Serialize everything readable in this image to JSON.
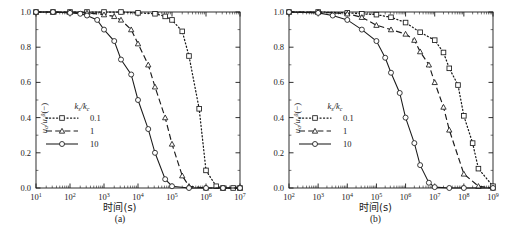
{
  "figure": {
    "panels": [
      {
        "id": "a",
        "caption": "(a)",
        "xlabel": "时间(s)",
        "ylabel_num": "u",
        "ylabel_sub": "a",
        "ylabel_den": "u",
        "ylabel_den_sub": "a",
        "ylabel_den_sup": "0",
        "ylabel_unit": "(−)",
        "legend_title_a": "k",
        "legend_title_a_sub": "s",
        "legend_title_b": "k",
        "legend_title_b_sub": "c",
        "legend_title": "k s / k c",
        "legend": [
          {
            "label": "0.1",
            "style": "dotted",
            "marker": "square"
          },
          {
            "label": "1",
            "style": "dashed",
            "marker": "triangle"
          },
          {
            "label": "10",
            "style": "solid",
            "marker": "circle"
          }
        ],
        "xticks": [
          "10¹",
          "10²",
          "10³",
          "10⁴",
          "10⁵",
          "10⁶",
          "10⁷"
        ],
        "xtick_exponents": [
          "1",
          "2",
          "3",
          "4",
          "5",
          "6",
          "7"
        ],
        "yticks": [
          "0.0",
          "0.2",
          "0.4",
          "0.6",
          "0.8",
          "1.0"
        ]
      },
      {
        "id": "b",
        "caption": "(b)",
        "xlabel": "时间(s)",
        "ylabel_num": "u",
        "ylabel_sub": "a",
        "ylabel_den": "u",
        "ylabel_den_sub": "a",
        "ylabel_den_sup": "0",
        "ylabel_unit": "(−)",
        "legend_title_a": "k",
        "legend_title_a_sub": "s",
        "legend_title_b": "k",
        "legend_title_b_sub": "c",
        "legend_title": "k s / k c",
        "legend": [
          {
            "label": "0.1",
            "style": "dotted",
            "marker": "square"
          },
          {
            "label": "1",
            "style": "dashed",
            "marker": "triangle"
          },
          {
            "label": "10",
            "style": "solid",
            "marker": "circle"
          }
        ],
        "xticks": [
          "10²",
          "10³",
          "10⁴",
          "10⁵",
          "10⁶",
          "10⁷",
          "10⁸",
          "10⁹"
        ],
        "xtick_exponents": [
          "2",
          "3",
          "4",
          "5",
          "6",
          "7",
          "8",
          "9"
        ],
        "yticks": [
          "0.0",
          "0.2",
          "0.4",
          "0.6",
          "0.8",
          "1.0"
        ]
      }
    ],
    "colors": {
      "line": "#1a1a1a",
      "axis": "#1a1a1a",
      "background": "#ffffff"
    }
  },
  "chart_data": [
    {
      "type": "line",
      "panel": "a",
      "title": "",
      "xlabel": "时间(s)",
      "ylabel": "u_a/u_a^0(−)",
      "xscale": "log",
      "xlim": [
        10,
        10000000
      ],
      "ylim": [
        0,
        1
      ],
      "grid": false,
      "legend_title": "k_s/k_c",
      "legend_position": "center-left",
      "series": [
        {
          "name": "0.1",
          "style": "dotted",
          "marker": "square",
          "x": [
            10,
            31.6,
            100,
            316,
            1000,
            3160,
            10000,
            31600,
            63000,
            100000,
            200000,
            316000,
            630000,
            1000000,
            2000000,
            3160000,
            6300000,
            10000000
          ],
          "y": [
            1.0,
            1.0,
            1.0,
            1.0,
            1.0,
            1.0,
            0.995,
            0.99,
            0.975,
            0.955,
            0.89,
            0.75,
            0.45,
            0.1,
            0.01,
            0.0,
            0.0,
            0.0
          ]
        },
        {
          "name": "1",
          "style": "dashed",
          "marker": "triangle",
          "x": [
            10,
            31.6,
            100,
            316,
            1000,
            2000,
            3160,
            6300,
            10000,
            20000,
            31600,
            63000,
            100000,
            200000,
            316000,
            1000000,
            3160000,
            10000000
          ],
          "y": [
            1.0,
            1.0,
            1.0,
            0.995,
            0.985,
            0.975,
            0.955,
            0.9,
            0.82,
            0.7,
            0.575,
            0.4,
            0.25,
            0.07,
            0.01,
            0.0,
            0.0,
            0.0
          ]
        },
        {
          "name": "10",
          "style": "solid",
          "marker": "circle",
          "x": [
            10,
            31.6,
            100,
            200,
            316,
            630,
            1000,
            2000,
            3160,
            6300,
            10000,
            20000,
            31600,
            63000,
            100000,
            316000,
            1000000,
            3160000,
            10000000
          ],
          "y": [
            1.0,
            1.0,
            0.995,
            0.99,
            0.98,
            0.955,
            0.9,
            0.835,
            0.73,
            0.645,
            0.5,
            0.335,
            0.2,
            0.05,
            0.01,
            0.0,
            0.0,
            0.0,
            0.0
          ]
        }
      ]
    },
    {
      "type": "line",
      "panel": "b",
      "title": "",
      "xlabel": "时间(s)",
      "ylabel": "u_a/u_a^0(−)",
      "xscale": "log",
      "xlim": [
        100,
        1000000000
      ],
      "ylim": [
        0,
        1
      ],
      "grid": false,
      "legend_title": "k_s/k_c",
      "legend_position": "center-left",
      "series": [
        {
          "name": "0.1",
          "style": "dotted",
          "marker": "square",
          "x": [
            100,
            1000,
            10000,
            31600,
            100000,
            316000,
            1000000,
            3160000,
            10000000,
            20000000,
            31600000,
            63000000,
            100000000,
            200000000,
            316000000,
            1000000000
          ],
          "y": [
            1.0,
            1.0,
            0.995,
            0.99,
            0.985,
            0.97,
            0.94,
            0.885,
            0.84,
            0.77,
            0.68,
            0.585,
            0.41,
            0.255,
            0.11,
            0.01
          ]
        },
        {
          "name": "1",
          "style": "dashed",
          "marker": "triangle",
          "x": [
            100,
            1000,
            10000,
            31600,
            100000,
            316000,
            1000000,
            2000000,
            3160000,
            6300000,
            10000000,
            20000000,
            31600000,
            100000000,
            316000000,
            1000000000
          ],
          "y": [
            1.0,
            1.0,
            0.99,
            0.97,
            0.925,
            0.9,
            0.875,
            0.84,
            0.775,
            0.7,
            0.6,
            0.46,
            0.33,
            0.08,
            0.01,
            0.0
          ]
        },
        {
          "name": "10",
          "style": "solid",
          "marker": "circle",
          "x": [
            100,
            1000,
            3160,
            10000,
            31600,
            100000,
            200000,
            316000,
            630000,
            1000000,
            2000000,
            3160000,
            6300000,
            10000000,
            31600000,
            100000000,
            1000000000
          ],
          "y": [
            1.0,
            0.995,
            0.98,
            0.955,
            0.9,
            0.835,
            0.74,
            0.655,
            0.54,
            0.4,
            0.255,
            0.13,
            0.03,
            0.005,
            0.0,
            0.0,
            0.0
          ]
        }
      ]
    }
  ]
}
